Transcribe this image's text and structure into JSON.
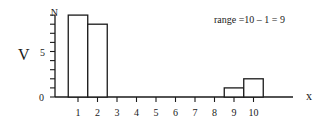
{
  "chart_data": {
    "type": "bar",
    "title": "",
    "annotation": "range =10 – 1 = 9",
    "xlabel": "x",
    "ylabel": "V",
    "categories": [
      "1",
      "2",
      "3",
      "4",
      "5",
      "6",
      "7",
      "8",
      "9",
      "10"
    ],
    "values": [
      9,
      8,
      0,
      0,
      0,
      0,
      0,
      0,
      1,
      2
    ],
    "ylim": [
      0,
      9
    ],
    "y_ticks": [
      0,
      1,
      2,
      3,
      4,
      5,
      6,
      7,
      8,
      9
    ],
    "y_tick_labels": {
      "0": "0",
      "5": "5",
      "9": "N"
    },
    "grid": false,
    "legend": "none"
  },
  "labels": {
    "ylabel": "V",
    "xlabel": "x",
    "annotation": "range =10 – 1 = 9",
    "y_zero": "0",
    "y_five": "5",
    "y_top": "N"
  },
  "colors": {
    "stroke": "#1a1a1a",
    "fill": "#ffffff"
  }
}
